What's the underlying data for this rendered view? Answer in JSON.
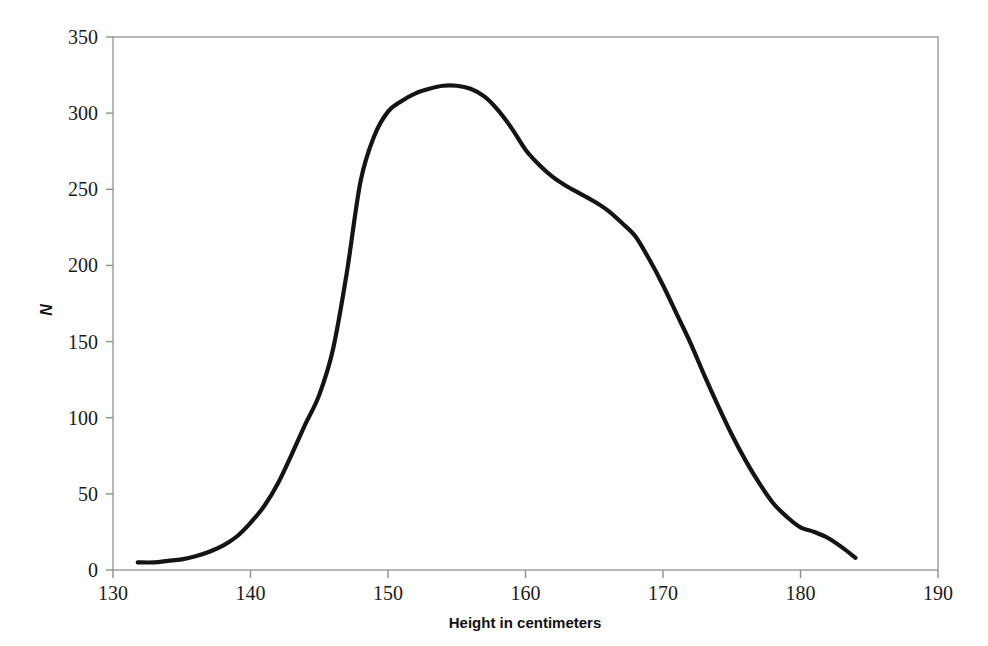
{
  "chart_data": {
    "type": "line",
    "title": "",
    "subtitle": "",
    "xlabel": "Height in centimeters",
    "ylabel": "N",
    "xlim": [
      130,
      190
    ],
    "ylim": [
      0,
      350
    ],
    "xticks": [
      130,
      140,
      150,
      160,
      170,
      180,
      190
    ],
    "xtick_labels": [
      "130",
      "140",
      "150",
      "160",
      "170",
      "180",
      "190"
    ],
    "yticks": [
      0,
      50,
      100,
      150,
      200,
      250,
      300,
      350
    ],
    "ytick_labels": [
      "0",
      "50",
      "100",
      "150",
      "200",
      "250",
      "300",
      "350"
    ],
    "grid": false,
    "legend": null,
    "legend_position": "none",
    "annotations": [],
    "series": [
      {
        "name": "Height distribution",
        "color": "#141414",
        "line_width": 4.2,
        "x": [
          131.8,
          133,
          134,
          135,
          136,
          137,
          138,
          139,
          140,
          141,
          142,
          143,
          144,
          145,
          146,
          147,
          148,
          149,
          150,
          151,
          152,
          153,
          154,
          155,
          156,
          157,
          158,
          159,
          160,
          161,
          162,
          163,
          164,
          165,
          166,
          167,
          168,
          169,
          170,
          171,
          172,
          173,
          174,
          175,
          176,
          177,
          178,
          179,
          180,
          181,
          182,
          183,
          184
        ],
        "y": [
          5,
          5,
          6,
          7,
          9,
          12,
          16,
          22,
          31,
          42,
          57,
          76,
          96,
          115,
          145,
          195,
          255,
          285,
          301,
          308,
          313,
          316,
          318,
          318,
          316,
          311,
          302,
          290,
          276,
          266,
          258,
          252,
          247,
          242,
          236,
          228,
          219,
          204,
          187,
          168,
          149,
          128,
          108,
          89,
          72,
          57,
          44,
          35,
          28,
          25,
          21,
          15,
          8
        ]
      }
    ]
  },
  "axes": {
    "x_axis_label": "Height in centimeters",
    "y_axis_label": "N"
  }
}
